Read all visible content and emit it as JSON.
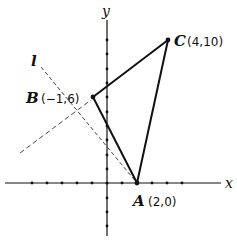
{
  "diagram": {
    "type": "coordinate-geometry",
    "axes": {
      "x_label": "x",
      "y_label": "y",
      "x_ticks": [
        -5,
        -4,
        -3,
        -2,
        -1,
        1,
        2,
        3,
        4,
        5
      ],
      "y_ticks": [
        -3,
        -2,
        -1,
        1,
        2,
        3,
        4,
        5,
        6,
        7,
        8,
        9,
        10
      ]
    },
    "points": [
      {
        "name": "A",
        "coords": "(2,0)",
        "x": 2,
        "y": 0
      },
      {
        "name": "B",
        "coords": "(−1,6)",
        "x": -1,
        "y": 6
      },
      {
        "name": "C",
        "coords": "(4,10)",
        "x": 4,
        "y": 10
      }
    ],
    "triangle": [
      "A",
      "B",
      "C"
    ],
    "line_label": "l",
    "dashed_lines": [
      {
        "name": "l",
        "description": "dashed line through A"
      },
      {
        "name": "dashed-2",
        "description": "dashed line ending near B"
      }
    ]
  },
  "labels": {
    "x_axis": "x",
    "y_axis": "y",
    "line_l": "l",
    "point_a_name": "A",
    "point_a_coords": "(2,0)",
    "point_b_name": "B",
    "point_b_coords": "(−1,6)",
    "point_c_name": "C",
    "point_c_coords": "(4,10)"
  },
  "colors": {
    "ink": "#111111",
    "dashed": "#333333",
    "background": "#ffffff"
  }
}
